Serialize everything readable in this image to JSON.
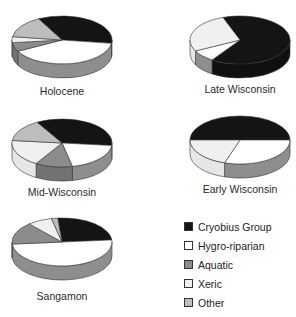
{
  "chart_data": {
    "type": "pie",
    "style": "3d",
    "categories": [
      "Cryobius Group",
      "Hygro-riparian",
      "Aquatic",
      "Xeric",
      "Other"
    ],
    "colors": {
      "Cryobius Group": "#141414",
      "Hygro-riparian": "#ffffff",
      "Aquatic": "#8c8c8c",
      "Xeric": "#f0f0f0",
      "Other": "#bdbdbd"
    },
    "charts": [
      {
        "title": "Holocene",
        "values": {
          "Cryobius Group": 35,
          "Hygro-riparian": 40,
          "Aquatic": 6,
          "Xeric": 4,
          "Other": 15
        }
      },
      {
        "title": "Late Wisconsin",
        "values": {
          "Cryobius Group": 65,
          "Hygro-riparian": 8,
          "Aquatic": 0,
          "Xeric": 27,
          "Other": 0
        }
      },
      {
        "title": "Mid-Wisconsin",
        "values": {
          "Cryobius Group": 35,
          "Hygro-riparian": 20,
          "Aquatic": 12,
          "Xeric": 18,
          "Other": 15
        }
      },
      {
        "title": "Early Wisconsin",
        "values": {
          "Cryobius Group": 50,
          "Hygro-riparian": 30,
          "Aquatic": 0,
          "Xeric": 20,
          "Other": 0
        }
      },
      {
        "title": "Sangamon",
        "values": {
          "Cryobius Group": 25,
          "Hygro-riparian": 50,
          "Aquatic": 15,
          "Xeric": 8,
          "Other": 2
        }
      }
    ],
    "legend_position": "bottom-right"
  },
  "labels": {
    "holocene": "Holocene",
    "late_wisconsin": "Late Wisconsin",
    "mid_wisconsin": "Mid-Wisconsin",
    "early_wisconsin": "Early Wisconsin",
    "sangamon": "Sangamon"
  },
  "legend": {
    "items": [
      {
        "label": "Cryobius Group",
        "color": "#141414"
      },
      {
        "label": "Hygro-riparian",
        "color": "#ffffff"
      },
      {
        "label": "Aquatic",
        "color": "#8c8c8c"
      },
      {
        "label": "Xeric",
        "color": "#f0f0f0"
      },
      {
        "label": "Other",
        "color": "#bdbdbd"
      }
    ]
  }
}
